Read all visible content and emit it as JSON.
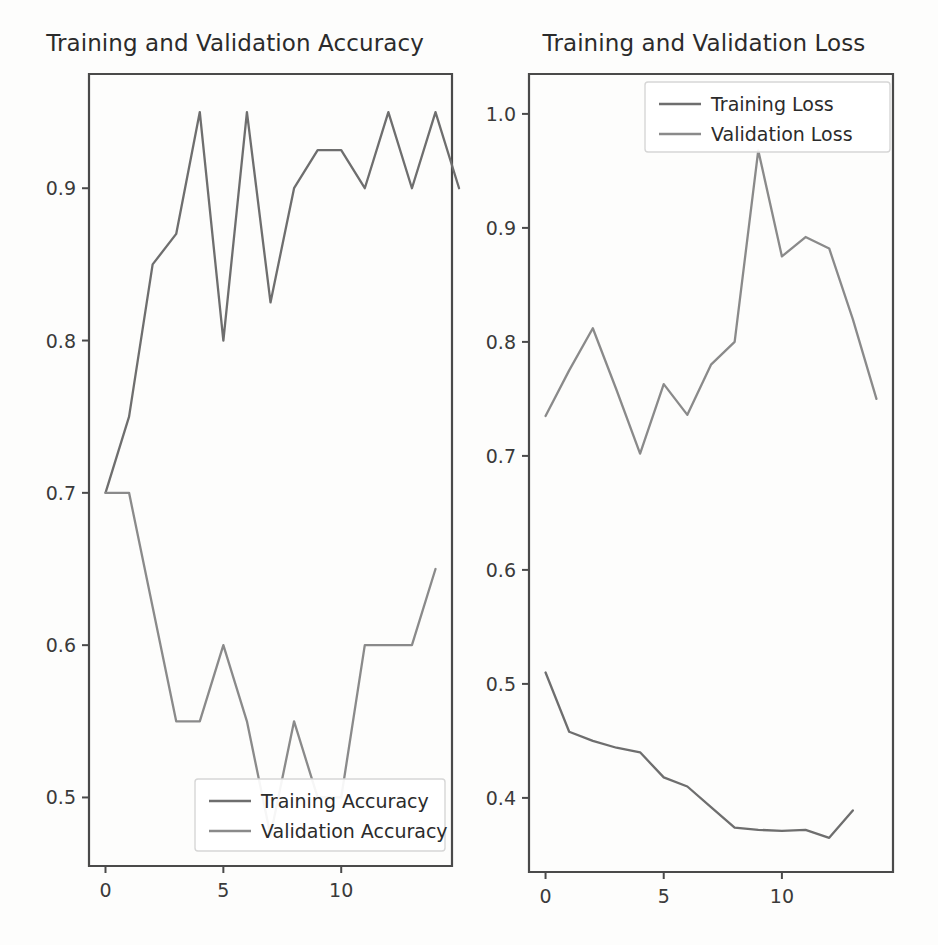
{
  "figure": {
    "background": "#fdfdfc",
    "line_color_train": "#6e6e6e",
    "line_color_val": "#8a8a8a",
    "axis_color": "#4a4a4a"
  },
  "panels": [
    {
      "id": "accuracy",
      "title": "Training and Validation Accuracy"
    },
    {
      "id": "loss",
      "title": "Training and Validation Loss"
    }
  ],
  "chart_data": [
    {
      "type": "line",
      "title": "Training and Validation Accuracy",
      "xlabel": "",
      "ylabel": "",
      "xlim": [
        -0.7,
        14.7
      ],
      "ylim": [
        0.455,
        0.975
      ],
      "xticks": [
        0,
        5,
        10
      ],
      "xticklabels": [
        "0",
        "5",
        "10"
      ],
      "yticks": [
        0.5,
        0.6,
        0.7,
        0.8,
        0.9
      ],
      "yticklabels": [
        "0.5",
        "0.6",
        "0.7",
        "0.8",
        "0.9"
      ],
      "grid": false,
      "legend_position": "lower right",
      "x": [
        0,
        1,
        2,
        3,
        4,
        5,
        6,
        7,
        8,
        9,
        10,
        11,
        12,
        13,
        14
      ],
      "series": [
        {
          "name": "Training Accuracy",
          "color": "#6e6e6e",
          "values": [
            0.7,
            0.75,
            0.85,
            0.87,
            0.95,
            0.8,
            0.95,
            0.825,
            0.9,
            0.925,
            0.925,
            0.9,
            0.95,
            0.9,
            0.95,
            0.9
          ]
        },
        {
          "name": "Validation Accuracy",
          "color": "#8a8a8a",
          "values": [
            0.7,
            0.7,
            0.625,
            0.55,
            0.55,
            0.6,
            0.55,
            0.475,
            0.55,
            0.5,
            0.5,
            0.6,
            0.6,
            0.6,
            0.65
          ]
        }
      ],
      "legend": [
        "Training Accuracy",
        "Validation Accuracy"
      ]
    },
    {
      "type": "line",
      "title": "Training and Validation Loss",
      "xlabel": "",
      "ylabel": "",
      "xlim": [
        -0.7,
        14.7
      ],
      "ylim": [
        0.335,
        1.035
      ],
      "xticks": [
        0,
        5,
        10
      ],
      "xticklabels": [
        "0",
        "5",
        "10"
      ],
      "yticks": [
        0.4,
        0.5,
        0.6,
        0.7,
        0.8,
        0.9,
        1.0
      ],
      "yticklabels": [
        "0.4",
        "0.5",
        "0.6",
        "0.7",
        "0.8",
        "0.9",
        "1.0"
      ],
      "grid": false,
      "legend_position": "upper center",
      "x": [
        0,
        1,
        2,
        3,
        4,
        5,
        6,
        7,
        8,
        9,
        10,
        11,
        12,
        13,
        14
      ],
      "series": [
        {
          "name": "Training Loss",
          "color": "#6e6e6e",
          "values": [
            0.51,
            0.458,
            0.45,
            0.444,
            0.44,
            0.418,
            0.41,
            0.392,
            0.374,
            0.372,
            0.371,
            0.372,
            0.365,
            0.389
          ]
        },
        {
          "name": "Validation Loss",
          "color": "#8a8a8a",
          "values": [
            0.735,
            0.775,
            0.812,
            0.758,
            0.702,
            0.763,
            0.736,
            0.78,
            0.8,
            0.968,
            0.875,
            0.892,
            0.882,
            0.82,
            0.75
          ]
        }
      ],
      "legend": [
        "Training Loss",
        "Validation Loss"
      ]
    }
  ]
}
